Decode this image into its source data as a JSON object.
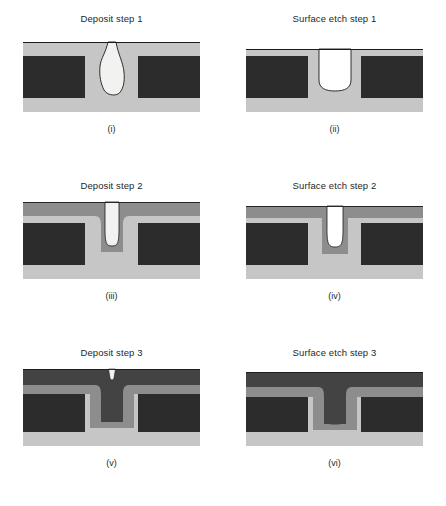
{
  "figure": {
    "type": "process-flow-cross-sections",
    "background_color": "#ffffff",
    "columns": 2,
    "rows": 3
  },
  "materials": {
    "substrate_block": {
      "name": "substrate-block",
      "color": "#2c2c2c"
    },
    "layer1_light": {
      "name": "first-deposited-layer",
      "color": "#c6c6c6"
    },
    "layer2_medium": {
      "name": "second-deposited-layer",
      "color": "#8d8d8d"
    },
    "layer3_dark": {
      "name": "third-deposited-layer",
      "color": "#434343"
    },
    "void": {
      "name": "void-region",
      "color": "#f2f2f0"
    },
    "outline": {
      "name": "profile-outline",
      "color": "#1a1a1a"
    }
  },
  "panels": [
    {
      "id": "i",
      "title": "Deposit step 1",
      "caption": "(i)",
      "row": 0,
      "column": 0,
      "stage": "deposit",
      "step": 1,
      "layers_present": [
        "substrate_block",
        "layer1_light",
        "void"
      ],
      "void_shape": "bottle-shaped-keyhole",
      "trench_state": "overhang-pinching"
    },
    {
      "id": "ii",
      "title": "Surface etch step 1",
      "caption": "(ii)",
      "row": 0,
      "column": 1,
      "stage": "etch",
      "step": 1,
      "layers_present": [
        "substrate_block",
        "layer1_light"
      ],
      "void_shape": "none",
      "trench_state": "reopened-tapered"
    },
    {
      "id": "iii",
      "title": "Deposit step 2",
      "caption": "(iii)",
      "row": 1,
      "column": 0,
      "stage": "deposit",
      "step": 2,
      "layers_present": [
        "substrate_block",
        "layer1_light",
        "layer2_medium",
        "void"
      ],
      "void_shape": "narrow-slot",
      "trench_state": "conformal-narrowed"
    },
    {
      "id": "iv",
      "title": "Surface etch step 2",
      "caption": "(iv)",
      "row": 1,
      "column": 1,
      "stage": "etch",
      "step": 2,
      "layers_present": [
        "substrate_block",
        "layer1_light",
        "layer2_medium"
      ],
      "void_shape": "none",
      "trench_state": "reopened-tapered"
    },
    {
      "id": "v",
      "title": "Deposit step 3",
      "caption": "(v)",
      "row": 2,
      "column": 0,
      "stage": "deposit",
      "step": 3,
      "layers_present": [
        "substrate_block",
        "layer1_light",
        "layer2_medium",
        "layer3_dark",
        "void"
      ],
      "void_shape": "small-surface-notch",
      "trench_state": "nearly-filled"
    },
    {
      "id": "vi",
      "title": "Surface etch step 3",
      "caption": "(vi)",
      "row": 2,
      "column": 1,
      "stage": "etch",
      "step": 3,
      "layers_present": [
        "substrate_block",
        "layer1_light",
        "layer2_medium",
        "layer3_dark"
      ],
      "void_shape": "none",
      "trench_state": "void-free-fill"
    }
  ]
}
